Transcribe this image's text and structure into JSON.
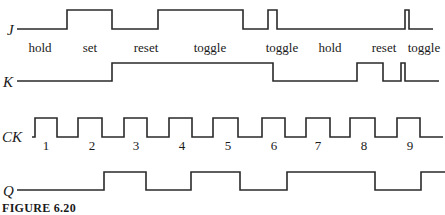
{
  "figure": {
    "caption": "FIGURE 6.20",
    "type": "JK flip-flop timing diagram"
  },
  "signals": [
    {
      "name": "J",
      "label": "J",
      "label_pos": [
        7,
        35
      ],
      "low_y": 29,
      "high_y": 10,
      "points": [
        [
          17,
          0
        ],
        [
          67,
          1
        ],
        [
          112,
          0
        ],
        [
          158,
          1
        ],
        [
          243,
          0
        ],
        [
          268,
          1
        ],
        [
          277,
          0
        ],
        [
          405,
          1
        ],
        [
          409,
          0
        ],
        [
          433,
          0
        ]
      ]
    },
    {
      "name": "K",
      "label": "K",
      "label_pos": [
        3,
        87
      ],
      "low_y": 81,
      "high_y": 63,
      "points": [
        [
          17,
          0
        ],
        [
          112,
          1
        ],
        [
          273,
          0
        ],
        [
          357,
          1
        ],
        [
          383,
          0
        ],
        [
          401,
          1
        ],
        [
          405,
          0
        ],
        [
          439,
          0
        ]
      ]
    },
    {
      "name": "CK",
      "label": "CK",
      "label_pos": [
        2,
        142
      ],
      "low_y": 137,
      "high_y": 118,
      "points": [
        [
          32,
          0
        ],
        [
          35,
          1
        ],
        [
          57,
          0
        ],
        [
          78,
          1
        ],
        [
          102,
          0
        ],
        [
          124,
          1
        ],
        [
          147,
          0
        ],
        [
          169,
          1
        ],
        [
          192,
          0
        ],
        [
          213,
          1
        ],
        [
          238,
          0
        ],
        [
          262,
          1
        ],
        [
          285,
          0
        ],
        [
          306,
          1
        ],
        [
          330,
          0
        ],
        [
          350,
          1
        ],
        [
          375,
          0
        ],
        [
          397,
          1
        ],
        [
          420,
          0
        ],
        [
          443,
          0
        ]
      ]
    },
    {
      "name": "Q",
      "label": "Q",
      "label_pos": [
        3,
        196
      ],
      "low_y": 190,
      "high_y": 172,
      "points": [
        [
          17,
          0
        ],
        [
          104,
          1
        ],
        [
          146,
          0
        ],
        [
          191,
          1
        ],
        [
          240,
          0
        ],
        [
          287,
          1
        ],
        [
          375,
          0
        ],
        [
          421,
          1
        ],
        [
          445,
          1
        ]
      ]
    }
  ],
  "states": [
    {
      "label": "hold",
      "x": 40
    },
    {
      "label": "set",
      "x": 90
    },
    {
      "label": "reset",
      "x": 146
    },
    {
      "label": "toggle",
      "x": 210
    },
    {
      "label": "toggle",
      "x": 282
    },
    {
      "label": "hold",
      "x": 330
    },
    {
      "label": "reset",
      "x": 384
    },
    {
      "label": "toggle",
      "x": 424
    }
  ],
  "clock_numbers": [
    {
      "label": "1",
      "x": 46
    },
    {
      "label": "2",
      "x": 92
    },
    {
      "label": "3",
      "x": 136
    },
    {
      "label": "4",
      "x": 182
    },
    {
      "label": "5",
      "x": 228
    },
    {
      "label": "6",
      "x": 274
    },
    {
      "label": "7",
      "x": 318
    },
    {
      "label": "8",
      "x": 364
    },
    {
      "label": "9",
      "x": 410
    }
  ],
  "colors": {
    "line": "#2a2a2a",
    "text": "#1a1a1a",
    "background": "#ffffff"
  }
}
